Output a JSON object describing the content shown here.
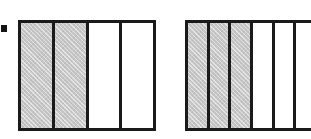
{
  "figure": {
    "caption": "",
    "background_color": "#ffffff",
    "ink_color": "#1a1a1a",
    "shade_color": "#c6c6c6",
    "marker": {
      "name": "square-bullet",
      "label": "",
      "x": 1,
      "y": 25,
      "width": 6,
      "height": 7,
      "color": "#141414"
    },
    "bars": [
      {
        "id": "bar-left",
        "label": "",
        "fraction_text": "",
        "total_parts": 4,
        "shaded_parts": 2,
        "x": 18,
        "y": 20,
        "width": 138,
        "height": 111,
        "clipped": false,
        "parts": [
          {
            "index": 1,
            "shaded": true,
            "label": ""
          },
          {
            "index": 2,
            "shaded": true,
            "label": ""
          },
          {
            "index": 3,
            "shaded": false,
            "label": ""
          },
          {
            "index": 4,
            "shaded": false,
            "label": ""
          }
        ]
      },
      {
        "id": "bar-right",
        "label": "",
        "fraction_text": "",
        "total_parts": 6,
        "shaded_parts": 3,
        "x": 185,
        "y": 20,
        "width": 130,
        "height": 111,
        "clipped": true,
        "parts": [
          {
            "index": 1,
            "shaded": true,
            "label": ""
          },
          {
            "index": 2,
            "shaded": true,
            "label": ""
          },
          {
            "index": 3,
            "shaded": true,
            "label": ""
          },
          {
            "index": 4,
            "shaded": false,
            "label": ""
          },
          {
            "index": 5,
            "shaded": false,
            "label": ""
          },
          {
            "index": 6,
            "shaded": false,
            "label": ""
          }
        ]
      }
    ]
  },
  "chart_data": {
    "type": "bar",
    "title": "",
    "subtitle": "",
    "xlabel": "",
    "ylabel": "",
    "grid": false,
    "legend": null,
    "annotations": [],
    "categories": [
      "left model",
      "right model"
    ],
    "series": [
      {
        "name": "shaded parts",
        "values": [
          2,
          3
        ]
      },
      {
        "name": "total parts",
        "values": [
          4,
          6
        ]
      },
      {
        "name": "fraction value",
        "values": [
          0.5,
          0.5
        ]
      }
    ]
  }
}
